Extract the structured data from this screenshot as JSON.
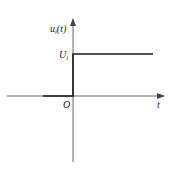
{
  "diagram": {
    "type": "step-function-plot",
    "y_axis_label": {
      "base": "u",
      "sub": "i",
      "rest": "(t)"
    },
    "level_label": {
      "base": "U",
      "sub": "i"
    },
    "origin_label": "O",
    "x_axis_label": "t",
    "colors": {
      "axis": "#555555",
      "signal": "#1a1a1a",
      "text": "#222222"
    }
  }
}
